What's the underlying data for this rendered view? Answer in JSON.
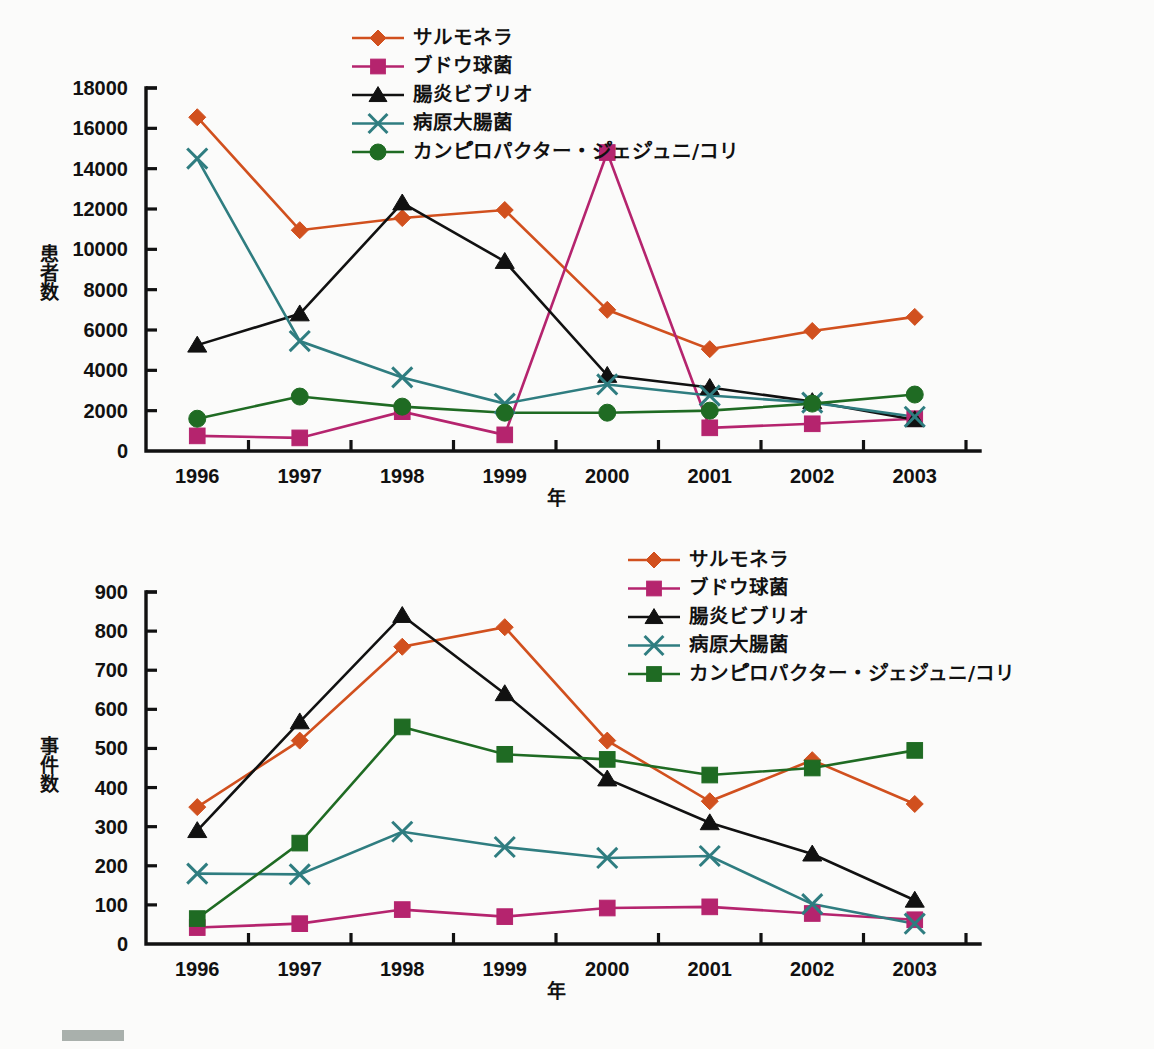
{
  "meta": {
    "background": "#fbfbfa",
    "marker_block_color": "#a9b0ac"
  },
  "series_colors": {
    "salmonella": "#d1501e",
    "staph": "#b5246e",
    "vibrio": "#111111",
    "ecoli": "#2f7d80",
    "campylobacter": "#1f6b23"
  },
  "charts": {
    "top": {
      "ylabel": "患者数",
      "xlabel": "年",
      "legend": [
        {
          "label": "サルモネラ",
          "marker": "diamond",
          "color": "#d1501e"
        },
        {
          "label": "ブドウ球菌",
          "marker": "square",
          "color": "#b5246e"
        },
        {
          "label": "腸炎ビブリオ",
          "marker": "triangle",
          "color": "#111111"
        },
        {
          "label": "病原大腸菌",
          "marker": "cross",
          "color": "#2f7d80"
        },
        {
          "label": "カンピ゚ロパクター・ジ゚ェジ゚ュニ/コリ",
          "marker": "circle",
          "color": "#1f6b23"
        }
      ]
    },
    "bottom": {
      "ylabel": "事件数",
      "xlabel": "年",
      "legend": [
        {
          "label": "サルモネラ",
          "marker": "diamond",
          "color": "#d1501e"
        },
        {
          "label": "ブドウ球菌",
          "marker": "square",
          "color": "#b5246e"
        },
        {
          "label": "腸炎ビブリオ",
          "marker": "triangle",
          "color": "#111111"
        },
        {
          "label": "病原大腸菌",
          "marker": "cross",
          "color": "#2f7d80"
        },
        {
          "label": "カンピ゚ロパクター・ジ゚ェジ゚ュニ/コリ",
          "marker": "square",
          "color": "#1f6b23"
        }
      ]
    }
  },
  "chart_data": [
    {
      "id": "top",
      "type": "line",
      "title": "",
      "xlabel": "年",
      "ylabel": "患者数",
      "categories": [
        "1996",
        "1997",
        "1998",
        "1999",
        "2000",
        "2001",
        "2002",
        "2003"
      ],
      "ylim": [
        0,
        18000
      ],
      "yticks": [
        0,
        2000,
        4000,
        6000,
        8000,
        10000,
        12000,
        14000,
        16000,
        18000
      ],
      "grid": false,
      "legend_position": "top-center",
      "series": [
        {
          "name": "サルモネラ",
          "marker": "diamond",
          "color": "#d1501e",
          "values": [
            16550,
            10950,
            11550,
            11950,
            7000,
            5050,
            5950,
            6650
          ]
        },
        {
          "name": "ブドウ球菌",
          "marker": "square",
          "color": "#b5246e",
          "values": [
            750,
            650,
            1950,
            800,
            14800,
            1150,
            1350,
            1600
          ]
        },
        {
          "name": "腸炎ビブリオ",
          "marker": "triangle",
          "color": "#111111",
          "values": [
            5250,
            6800,
            12300,
            9400,
            3750,
            3150,
            2450,
            1550
          ]
        },
        {
          "name": "病原大腸菌",
          "marker": "cross",
          "color": "#2f7d80",
          "values": [
            14500,
            5450,
            3650,
            2350,
            3300,
            2750,
            2400,
            1700
          ]
        },
        {
          "name": "カンピ゚ロパクター・ジ゚ェジ゚ュニ/コリ",
          "marker": "circle",
          "color": "#1f6b23",
          "values": [
            1600,
            2700,
            2200,
            1900,
            1900,
            2000,
            2350,
            2800
          ]
        }
      ]
    },
    {
      "id": "bottom",
      "type": "line",
      "title": "",
      "xlabel": "年",
      "ylabel": "事件数",
      "categories": [
        "1996",
        "1997",
        "1998",
        "1999",
        "2000",
        "2001",
        "2002",
        "2003"
      ],
      "ylim": [
        0,
        900
      ],
      "yticks": [
        0,
        100,
        200,
        300,
        400,
        500,
        600,
        700,
        800,
        900
      ],
      "grid": false,
      "legend_position": "top-right",
      "series": [
        {
          "name": "サルモネラ",
          "marker": "diamond",
          "color": "#d1501e",
          "values": [
            350,
            520,
            760,
            810,
            520,
            365,
            470,
            358
          ]
        },
        {
          "name": "ブドウ球菌",
          "marker": "square",
          "color": "#b5246e",
          "values": [
            42,
            52,
            88,
            70,
            92,
            95,
            78,
            62
          ]
        },
        {
          "name": "腸炎ビブリオ",
          "marker": "triangle",
          "color": "#111111",
          "values": [
            290,
            568,
            840,
            640,
            422,
            310,
            230,
            112
          ]
        },
        {
          "name": "病原大腸菌",
          "marker": "cross",
          "color": "#2f7d80",
          "values": [
            180,
            178,
            287,
            248,
            220,
            225,
            102,
            52
          ]
        },
        {
          "name": "カンピ゚ロパクター・ジ゚ェジ゚ュニ/コリ",
          "marker": "square",
          "color": "#1f6b23",
          "values": [
            65,
            258,
            555,
            485,
            472,
            432,
            450,
            495
          ]
        }
      ]
    }
  ]
}
